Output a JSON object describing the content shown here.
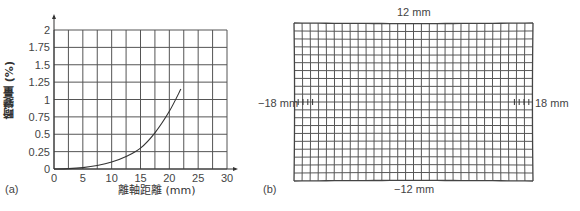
{
  "chart_data": [
    {
      "panel": "(a)",
      "type": "line",
      "title": "",
      "xlabel": "離軸距離 (mm)",
      "ylabel": "畸變量 (%)",
      "xlim": [
        0,
        30
      ],
      "ylim": [
        0,
        2
      ],
      "x_ticks": [
        "0",
        "5",
        "10",
        "15",
        "20",
        "25",
        "30"
      ],
      "y_ticks": [
        "0",
        "0.25",
        "0.5",
        "0.75",
        "1",
        "1.25",
        "1.5",
        "1.75",
        "2"
      ],
      "grid": true,
      "grid_x_step": 2.5,
      "grid_y_step": 0.25,
      "series": [
        {
          "name": "distortion",
          "x": [
            0,
            2.5,
            5,
            7.5,
            10,
            12.5,
            15,
            17.5,
            20,
            22
          ],
          "y": [
            0,
            0.005,
            0.02,
            0.05,
            0.1,
            0.18,
            0.3,
            0.52,
            0.83,
            1.15
          ]
        }
      ]
    },
    {
      "panel": "(b)",
      "type": "heatmap",
      "description": "distorted grid pattern",
      "labels": {
        "top": "12 mm",
        "bottom": "−12 mm",
        "left": "−18 mm",
        "right": "18 mm"
      },
      "grid_columns": 30,
      "grid_rows": 20
    }
  ],
  "panel_a": {
    "label": "(a)",
    "xlabel": "離軸距離 (mm)",
    "ylabel": "畸變量 (%)"
  },
  "panel_b": {
    "label": "(b)",
    "top": "12 mm",
    "bottom": "−12 mm",
    "left": "−18 mm",
    "right": "18 mm"
  },
  "colors": {
    "grid": "#555555",
    "curve": "#333333",
    "text": "#444444"
  }
}
